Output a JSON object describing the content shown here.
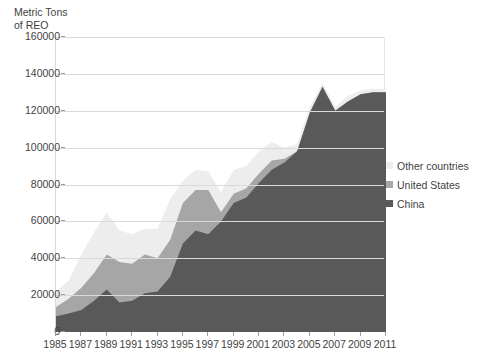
{
  "axis_title": "Metric Tons\nof REO",
  "legend": {
    "position": "right",
    "items": [
      {
        "label": "Other countries",
        "color": "#ededed"
      },
      {
        "label": "United States",
        "color": "#a6a6a6"
      },
      {
        "label": "China",
        "color": "#595959"
      }
    ]
  },
  "chart_data": {
    "type": "area",
    "stacked": true,
    "title": "",
    "subtitle": "",
    "xlabel": "",
    "ylabel": "Metric Tons of REO",
    "xlim": [
      1985,
      2011
    ],
    "ylim": [
      0,
      160000
    ],
    "ytick_step": 20000,
    "xtick_step": 2,
    "grid": true,
    "x": [
      1985,
      1986,
      1987,
      1988,
      1989,
      1990,
      1991,
      1992,
      1993,
      1994,
      1995,
      1996,
      1997,
      1998,
      1999,
      2000,
      2001,
      2002,
      2003,
      2004,
      2005,
      2006,
      2007,
      2008,
      2009,
      2010,
      2011
    ],
    "xtick_labels": [
      "1985",
      "1987",
      "1989",
      "1991",
      "1993",
      "1995",
      "1997",
      "1999",
      "2001",
      "2003",
      "2005",
      "2007",
      "2009",
      "2011"
    ],
    "ytick_labels": [
      "0",
      "20000",
      "40000",
      "60000",
      "80000",
      "100000",
      "120000",
      "140000",
      "160000"
    ],
    "series": [
      {
        "name": "China",
        "color": "#595959",
        "values": [
          8500,
          10000,
          12000,
          17000,
          23000,
          16000,
          17000,
          21000,
          22000,
          30000,
          48000,
          55000,
          53000,
          60000,
          70000,
          73000,
          81000,
          88000,
          92000,
          98000,
          119000,
          133000,
          120000,
          125000,
          129000,
          130000,
          130000
        ]
      },
      {
        "name": "United States",
        "color": "#a6a6a6",
        "values": [
          5000,
          8000,
          12000,
          15000,
          19000,
          22000,
          20000,
          21000,
          18000,
          20000,
          22000,
          22000,
          24000,
          5000,
          5000,
          5000,
          5000,
          5000,
          2000,
          0,
          0,
          0,
          0,
          0,
          0,
          0,
          0
        ]
      },
      {
        "name": "Other countries",
        "color": "#ededed",
        "values": [
          8500,
          10000,
          18000,
          22000,
          23000,
          17000,
          16000,
          14000,
          16000,
          22000,
          12000,
          11000,
          10000,
          11000,
          13000,
          12000,
          12000,
          10000,
          6000,
          4000,
          3000,
          2000,
          2000,
          3000,
          2000,
          2000,
          2000
        ]
      }
    ],
    "totals": [
      22000,
      28000,
      42000,
      54000,
      65000,
      55000,
      53000,
      56000,
      56000,
      72000,
      82000,
      88000,
      87000,
      76000,
      88000,
      90000,
      98000,
      103000,
      100000,
      102000,
      122000,
      135000,
      122000,
      128000,
      131000,
      132000,
      132000
    ]
  }
}
